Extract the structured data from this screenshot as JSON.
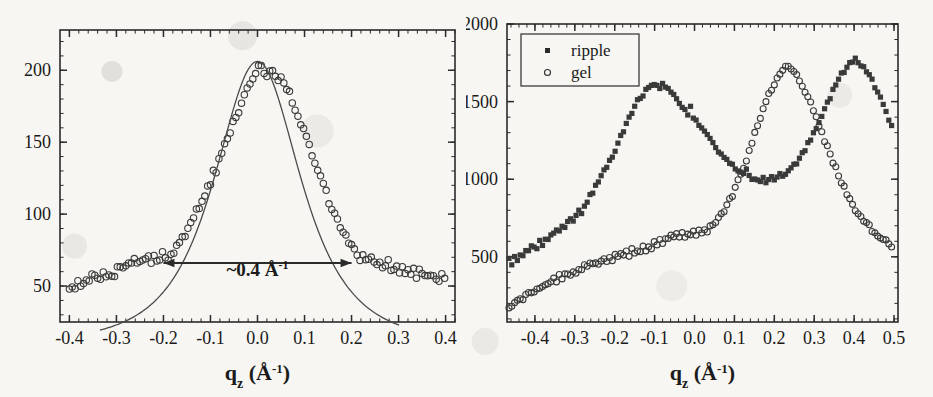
{
  "figure": {
    "background_color": "#f7f6f3",
    "ink_color": "#2b2b2b",
    "panel_count": 2
  },
  "chart_data": [
    {
      "panel": "left",
      "type": "scatter",
      "title": "",
      "xlabel": "q_z (Å-1)",
      "xlabel_parts": {
        "base": "q",
        "sub": "z",
        "unit_open": " (Å",
        "unit_sup": "-1",
        "unit_close": ")"
      },
      "ylabel": "",
      "xlim": [
        -0.42,
        0.42
      ],
      "ylim": [
        25,
        228
      ],
      "xticks": [
        -0.4,
        -0.3,
        -0.2,
        -0.1,
        0.0,
        0.1,
        0.2,
        0.3,
        0.4
      ],
      "xticklabels": [
        "-0.4",
        "-0.3",
        "-0.2",
        "-0.1",
        "0.0",
        "0.1",
        "0.2",
        "0.3",
        "0.4"
      ],
      "yticks": [
        50,
        100,
        150,
        200
      ],
      "yticklabels": [
        "50",
        "100",
        "150",
        "200"
      ],
      "grid": false,
      "legend": null,
      "minor_ticks": true,
      "ticks_direction": "in",
      "frame": "box",
      "annotations": [
        {
          "name": "fwhm-arrow-label",
          "text": "~0.4 Å-1",
          "text_parts": {
            "body": "~0.4 Å",
            "sup": "-1"
          },
          "x": 0.0,
          "y": 57,
          "arrow_from_x": -0.2,
          "arrow_to_x": 0.2,
          "arrow_y": 66,
          "arrow_style": "double-headed"
        }
      ],
      "series": [
        {
          "name": "data",
          "marker": "open-circle",
          "marker_size": 3.2,
          "color": "#3a3a3a",
          "x": [
            -0.4,
            -0.394,
            -0.388,
            -0.382,
            -0.376,
            -0.37,
            -0.364,
            -0.358,
            -0.352,
            -0.346,
            -0.34,
            -0.334,
            -0.328,
            -0.322,
            -0.316,
            -0.31,
            -0.304,
            -0.298,
            -0.292,
            -0.286,
            -0.28,
            -0.274,
            -0.268,
            -0.262,
            -0.256,
            -0.25,
            -0.244,
            -0.238,
            -0.232,
            -0.226,
            -0.22,
            -0.214,
            -0.208,
            -0.202,
            -0.196,
            -0.19,
            -0.184,
            -0.178,
            -0.172,
            -0.166,
            -0.16,
            -0.154,
            -0.148,
            -0.142,
            -0.136,
            -0.13,
            -0.124,
            -0.118,
            -0.112,
            -0.106,
            -0.1,
            -0.094,
            -0.088,
            -0.082,
            -0.076,
            -0.07,
            -0.064,
            -0.058,
            -0.052,
            -0.046,
            -0.04,
            -0.034,
            -0.028,
            -0.022,
            -0.016,
            -0.01,
            -0.004,
            0.002,
            0.008,
            0.014,
            0.02,
            0.026,
            0.032,
            0.038,
            0.044,
            0.05,
            0.056,
            0.062,
            0.068,
            0.074,
            0.08,
            0.086,
            0.092,
            0.098,
            0.104,
            0.11,
            0.116,
            0.122,
            0.128,
            0.134,
            0.14,
            0.146,
            0.152,
            0.158,
            0.164,
            0.17,
            0.176,
            0.182,
            0.188,
            0.194,
            0.2,
            0.206,
            0.212,
            0.218,
            0.224,
            0.23,
            0.236,
            0.242,
            0.248,
            0.254,
            0.26,
            0.266,
            0.272,
            0.278,
            0.284,
            0.29,
            0.296,
            0.302,
            0.308,
            0.314,
            0.32,
            0.326,
            0.332,
            0.338,
            0.344,
            0.35,
            0.356,
            0.362,
            0.368,
            0.374,
            0.38,
            0.386,
            0.392,
            0.398
          ],
          "y": [
            49,
            51,
            50,
            53,
            52,
            50,
            54,
            53,
            56,
            55,
            57,
            54,
            58,
            57,
            60,
            59,
            57,
            62,
            61,
            64,
            63,
            66,
            65,
            68,
            66,
            69,
            67,
            71,
            70,
            68,
            72,
            70,
            69,
            72,
            71,
            70,
            74,
            73,
            77,
            80,
            82,
            86,
            89,
            93,
            96,
            101,
            104,
            109,
            113,
            118,
            122,
            128,
            131,
            137,
            141,
            147,
            152,
            158,
            162,
            168,
            173,
            178,
            182,
            188,
            191,
            196,
            198,
            203,
            205,
            200,
            197,
            202,
            199,
            195,
            192,
            196,
            190,
            187,
            183,
            178,
            174,
            169,
            164,
            158,
            153,
            147,
            142,
            136,
            130,
            125,
            119,
            114,
            109,
            104,
            99,
            95,
            91,
            87,
            83,
            80,
            77,
            74,
            72,
            70,
            71,
            69,
            68,
            70,
            67,
            66,
            68,
            65,
            64,
            66,
            63,
            62,
            64,
            61,
            63,
            60,
            62,
            59,
            61,
            58,
            60,
            57,
            59,
            56,
            58,
            55,
            57,
            54,
            56,
            53
          ]
        },
        {
          "name": "fit",
          "type": "line",
          "color": "#555555",
          "description": "smooth Lorentzian-like fit curve through the peak, tails dropping below data at |q| > 0.2"
        }
      ]
    },
    {
      "panel": "right",
      "type": "scatter",
      "title": "",
      "xlabel": "q_z (Å-1)",
      "xlabel_parts": {
        "base": "q",
        "sub": "z",
        "unit_open": " (Å",
        "unit_sup": "-1",
        "unit_close": ")"
      },
      "ylabel": "",
      "xlim": [
        -0.47,
        0.51
      ],
      "ylim": [
        80,
        2000
      ],
      "xticks": [
        -0.4,
        -0.3,
        -0.2,
        -0.1,
        0.0,
        0.1,
        0.2,
        0.3,
        0.4,
        0.5
      ],
      "xticklabels": [
        "-0.4",
        "-0.3",
        "-0.2",
        "-0.1",
        "0.0",
        "0.1",
        "0.2",
        "0.3",
        "0.4",
        "0.5"
      ],
      "yticks": [
        500,
        1000,
        1500,
        2000
      ],
      "yticklabels": [
        "500",
        "1000",
        "1500",
        "2000"
      ],
      "grid": false,
      "minor_ticks": true,
      "ticks_direction": "in",
      "frame": "box",
      "legend": {
        "position": "top-left",
        "border": true,
        "entries": [
          {
            "label": "ripple",
            "marker": "filled-square"
          },
          {
            "label": "gel",
            "marker": "open-circle"
          }
        ]
      },
      "series": [
        {
          "name": "ripple",
          "marker": "filled-square",
          "marker_size": 2.6,
          "color": "#3a3a3a",
          "x": [
            -0.465,
            -0.458,
            -0.451,
            -0.444,
            -0.437,
            -0.43,
            -0.423,
            -0.416,
            -0.409,
            -0.402,
            -0.395,
            -0.388,
            -0.381,
            -0.374,
            -0.367,
            -0.36,
            -0.353,
            -0.346,
            -0.339,
            -0.332,
            -0.325,
            -0.318,
            -0.311,
            -0.304,
            -0.297,
            -0.29,
            -0.283,
            -0.276,
            -0.269,
            -0.262,
            -0.255,
            -0.248,
            -0.241,
            -0.234,
            -0.227,
            -0.22,
            -0.213,
            -0.206,
            -0.199,
            -0.192,
            -0.185,
            -0.178,
            -0.171,
            -0.164,
            -0.157,
            -0.15,
            -0.143,
            -0.136,
            -0.129,
            -0.122,
            -0.115,
            -0.108,
            -0.101,
            -0.094,
            -0.087,
            -0.08,
            -0.073,
            -0.066,
            -0.059,
            -0.052,
            -0.045,
            -0.038,
            -0.031,
            -0.024,
            -0.017,
            -0.01,
            -0.003,
            0.004,
            0.011,
            0.018,
            0.025,
            0.032,
            0.039,
            0.046,
            0.053,
            0.06,
            0.067,
            0.074,
            0.081,
            0.088,
            0.095,
            0.102,
            0.109,
            0.116,
            0.123,
            0.13,
            0.137,
            0.144,
            0.151,
            0.158,
            0.165,
            0.172,
            0.179,
            0.186,
            0.193,
            0.2,
            0.207,
            0.214,
            0.221,
            0.228,
            0.235,
            0.242,
            0.249,
            0.256,
            0.263,
            0.27,
            0.277,
            0.284,
            0.291,
            0.298,
            0.305,
            0.312,
            0.319,
            0.326,
            0.333,
            0.34,
            0.347,
            0.354,
            0.361,
            0.368,
            0.375,
            0.382,
            0.389,
            0.396,
            0.403,
            0.41,
            0.417,
            0.424,
            0.431,
            0.438,
            0.445,
            0.452,
            0.459,
            0.466,
            0.473,
            0.48,
            0.487,
            0.494
          ],
          "y": [
            490,
            455,
            500,
            480,
            520,
            505,
            545,
            530,
            560,
            575,
            555,
            600,
            585,
            625,
            610,
            650,
            640,
            680,
            665,
            700,
            690,
            720,
            745,
            735,
            775,
            800,
            790,
            835,
            860,
            890,
            920,
            955,
            985,
            1020,
            1060,
            1080,
            1110,
            1150,
            1185,
            1230,
            1270,
            1310,
            1350,
            1395,
            1430,
            1465,
            1500,
            1520,
            1545,
            1570,
            1590,
            1600,
            1615,
            1600,
            1590,
            1610,
            1595,
            1575,
            1560,
            1540,
            1515,
            1490,
            1465,
            1440,
            1420,
            1460,
            1395,
            1370,
            1345,
            1320,
            1300,
            1275,
            1250,
            1230,
            1205,
            1180,
            1160,
            1140,
            1115,
            1100,
            1085,
            1070,
            1060,
            1045,
            1035,
            1060,
            1025,
            1010,
            1000,
            1005,
            990,
            1000,
            965,
            1000,
            1010,
            1005,
            1015,
            1030,
            1025,
            1040,
            1055,
            1070,
            1090,
            1110,
            1135,
            1160,
            1190,
            1225,
            1255,
            1290,
            1330,
            1370,
            1410,
            1450,
            1490,
            1530,
            1570,
            1610,
            1650,
            1680,
            1700,
            1725,
            1745,
            1760,
            1775,
            1750,
            1740,
            1720,
            1700,
            1670,
            1635,
            1600,
            1560,
            1520,
            1480,
            1435,
            1390,
            1345
          ]
        },
        {
          "name": "gel",
          "marker": "open-circle",
          "marker_size": 3.0,
          "color": "#3a3a3a",
          "x": [
            -0.465,
            -0.458,
            -0.451,
            -0.444,
            -0.437,
            -0.43,
            -0.423,
            -0.416,
            -0.409,
            -0.402,
            -0.395,
            -0.388,
            -0.381,
            -0.374,
            -0.367,
            -0.36,
            -0.353,
            -0.346,
            -0.339,
            -0.332,
            -0.325,
            -0.318,
            -0.311,
            -0.304,
            -0.297,
            -0.29,
            -0.283,
            -0.276,
            -0.269,
            -0.262,
            -0.255,
            -0.248,
            -0.241,
            -0.234,
            -0.227,
            -0.22,
            -0.213,
            -0.206,
            -0.199,
            -0.192,
            -0.185,
            -0.178,
            -0.171,
            -0.164,
            -0.157,
            -0.15,
            -0.143,
            -0.136,
            -0.129,
            -0.122,
            -0.115,
            -0.108,
            -0.101,
            -0.094,
            -0.087,
            -0.08,
            -0.073,
            -0.066,
            -0.059,
            -0.052,
            -0.045,
            -0.038,
            -0.031,
            -0.024,
            -0.017,
            -0.01,
            -0.003,
            0.004,
            0.011,
            0.018,
            0.025,
            0.032,
            0.039,
            0.046,
            0.053,
            0.06,
            0.067,
            0.074,
            0.081,
            0.088,
            0.095,
            0.102,
            0.109,
            0.116,
            0.123,
            0.13,
            0.137,
            0.144,
            0.151,
            0.158,
            0.165,
            0.172,
            0.179,
            0.186,
            0.193,
            0.2,
            0.207,
            0.214,
            0.221,
            0.228,
            0.235,
            0.242,
            0.249,
            0.256,
            0.263,
            0.27,
            0.277,
            0.284,
            0.291,
            0.298,
            0.305,
            0.312,
            0.319,
            0.326,
            0.333,
            0.34,
            0.347,
            0.354,
            0.361,
            0.368,
            0.375,
            0.382,
            0.389,
            0.396,
            0.403,
            0.41,
            0.417,
            0.424,
            0.431,
            0.438,
            0.445,
            0.452,
            0.459,
            0.466,
            0.473,
            0.48,
            0.487,
            0.494
          ],
          "y": [
            170,
            185,
            200,
            215,
            230,
            225,
            250,
            265,
            255,
            285,
            300,
            290,
            320,
            310,
            340,
            330,
            355,
            345,
            375,
            365,
            390,
            400,
            385,
            415,
            405,
            430,
            420,
            440,
            430,
            455,
            445,
            465,
            455,
            475,
            490,
            470,
            500,
            485,
            510,
            495,
            520,
            505,
            530,
            515,
            540,
            525,
            550,
            535,
            560,
            545,
            570,
            555,
            585,
            570,
            600,
            590,
            620,
            605,
            635,
            620,
            645,
            630,
            650,
            635,
            655,
            640,
            660,
            650,
            670,
            655,
            680,
            665,
            695,
            710,
            725,
            745,
            770,
            800,
            830,
            865,
            900,
            940,
            985,
            1030,
            1080,
            1130,
            1185,
            1240,
            1295,
            1350,
            1400,
            1450,
            1495,
            1540,
            1580,
            1620,
            1655,
            1680,
            1705,
            1720,
            1730,
            1715,
            1700,
            1675,
            1645,
            1610,
            1570,
            1530,
            1485,
            1440,
            1395,
            1345,
            1300,
            1250,
            1205,
            1160,
            1115,
            1070,
            1025,
            985,
            945,
            905,
            870,
            840,
            810,
            785,
            760,
            735,
            715,
            695,
            675,
            660,
            645,
            630,
            615,
            600,
            585,
            570
          ]
        }
      ]
    }
  ]
}
